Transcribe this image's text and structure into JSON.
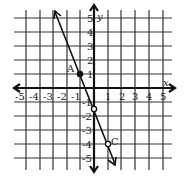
{
  "graph": {
    "x_axis_label": "x",
    "y_axis_label": "y",
    "x_ticks": [
      "-5",
      "-4",
      "-3",
      "-2",
      "-1",
      "1",
      "2",
      "3",
      "4",
      "5"
    ],
    "y_ticks_pos": [
      "5",
      "4",
      "3",
      "2",
      "1"
    ],
    "y_ticks_neg": [
      "-1",
      "-2",
      "-3",
      "-4",
      "-5"
    ],
    "points": [
      {
        "label": "A",
        "x": -1,
        "y": 1
      },
      {
        "label": "",
        "x": 0,
        "y": -1.5
      },
      {
        "label": "C",
        "x": 1,
        "y": -4
      }
    ],
    "line": {
      "slope": -2.5,
      "intercept": -1.5
    }
  }
}
